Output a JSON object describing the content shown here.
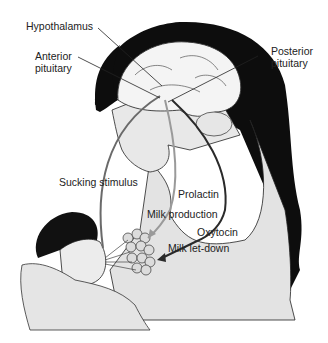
{
  "diagram": {
    "labels": {
      "hypothalamus": "Hypothalamus",
      "anterior_pituitary_line1": "Anterior",
      "anterior_pituitary_line2": "pituitary",
      "posterior_pituitary_line1": "Posterior",
      "posterior_pituitary_line2": "pituitary",
      "sucking_stimulus": "Sucking stimulus",
      "prolactin": "Prolactin",
      "milk_production": "Milk production",
      "oxytocin": "Oxytocin",
      "milk_let_down": "Milk let-down"
    },
    "pathways": [
      {
        "from": "Nipple (infant sucking)",
        "to": "Hypothalamus",
        "label": "Sucking stimulus",
        "color": "#6a6a6a"
      },
      {
        "from": "Anterior pituitary",
        "to": "Mammary alveoli",
        "label": "Prolactin",
        "result": "Milk production",
        "color": "#9a9a9a"
      },
      {
        "from": "Posterior pituitary",
        "to": "Mammary alveoli",
        "label": "Oxytocin",
        "result": "Milk let-down",
        "color": "#2a2a2a"
      }
    ],
    "colors": {
      "hair": "#0d0d0d",
      "skin": "#e2e2e2",
      "brain": "#f4f4f4",
      "outline": "#333333"
    }
  }
}
